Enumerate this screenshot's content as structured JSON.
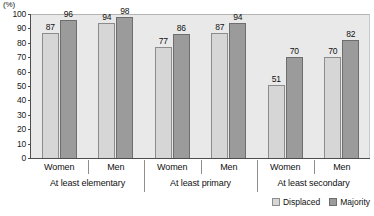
{
  "chart_data": {
    "type": "bar",
    "title": "",
    "subtitle": "",
    "xlabel": "",
    "ylabel": "(%)",
    "unit_label": "(%)",
    "ylim": [
      0,
      100
    ],
    "ytick_step": 10,
    "yticks": [
      "100",
      "90",
      "80",
      "70",
      "60",
      "50",
      "40",
      "30",
      "20",
      "10",
      "0"
    ],
    "grid": false,
    "legend_position": "bottom-right",
    "categories": [
      "Women",
      "Men",
      "Women",
      "Men",
      "Women",
      "Men"
    ],
    "groups": [
      {
        "label": "At least elementary",
        "subcategories": [
          "Women",
          "Men"
        ]
      },
      {
        "label": "At least primary",
        "subcategories": [
          "Women",
          "Men"
        ]
      },
      {
        "label": "At least secondary",
        "subcategories": [
          "Women",
          "Men"
        ]
      }
    ],
    "series": [
      {
        "name": "Displaced",
        "color": "#d6d6d6",
        "values": [
          87,
          94,
          77,
          87,
          51,
          70
        ]
      },
      {
        "name": "Majority",
        "color": "#9b9b9b",
        "values": [
          96,
          98,
          86,
          94,
          70,
          82
        ]
      }
    ],
    "data_labels": [
      "87",
      "96",
      "94",
      "98",
      "77",
      "86",
      "87",
      "94",
      "51",
      "70",
      "70",
      "82"
    ]
  },
  "legend": {
    "items": [
      {
        "label": "Displaced",
        "swatch": "displaced-swatch"
      },
      {
        "label": "Majority",
        "swatch": "majority-swatch"
      }
    ]
  },
  "axis": {
    "unit": "(%)"
  }
}
